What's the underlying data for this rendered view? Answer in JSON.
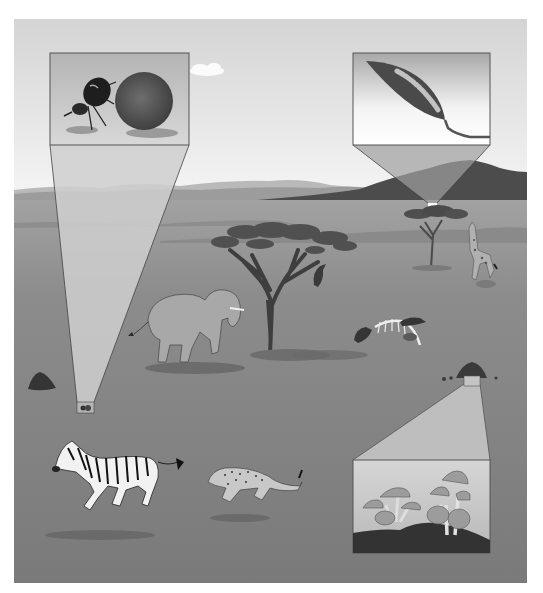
{
  "scene": {
    "description": "Grayscale illustration of a savanna ecosystem with three magnified inset panels",
    "frame": {
      "x": 14,
      "y": 19,
      "width": 513,
      "height": 564
    },
    "colors": {
      "page_bg": "#ffffff",
      "sky_top": "#d6d6d6",
      "sky_bottom": "#f4f4f4",
      "far_hills": "#a9a9a9",
      "mid_hills": "#8a8a8a",
      "mountain_dark": "#4a4a4a",
      "mountain_light": "#9a9a9a",
      "ground_far": "#9c9c9c",
      "ground_near": "#7c7c7c",
      "callout_fill": "#c8c8c8",
      "callout_line": "#555555",
      "inset_border": "#5a5a5a"
    }
  },
  "insets": [
    {
      "name": "dung-beetle-inset",
      "subject": "dung beetle rolling a dung ball",
      "box": {
        "x": 50,
        "y": 53,
        "w": 139,
        "h": 92
      },
      "source": {
        "x": 77,
        "y": 402,
        "w": 17,
        "h": 11
      }
    },
    {
      "name": "caterpillar-inset",
      "subject": "caterpillar on a leaf",
      "box": {
        "x": 353,
        "y": 53,
        "w": 137,
        "h": 92
      },
      "source": {
        "x": 428,
        "y": 203,
        "w": 9,
        "h": 8
      }
    },
    {
      "name": "mushroom-inset",
      "subject": "mushrooms growing from soil",
      "box": {
        "x": 353,
        "y": 460,
        "w": 137,
        "h": 93
      },
      "source": {
        "x": 464,
        "y": 372,
        "w": 16,
        "h": 14
      }
    }
  ],
  "animals": [
    "elephant",
    "zebra",
    "cheetah",
    "giraffe",
    "vulture",
    "vultures at carcass"
  ],
  "objects": [
    "acacia tree (large)",
    "acacia tree (small)",
    "termite mound",
    "dung pile",
    "skeleton carcass",
    "cloud"
  ]
}
